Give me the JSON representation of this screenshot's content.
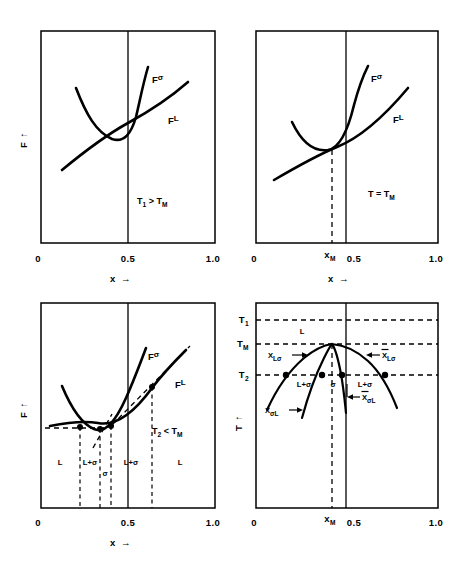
{
  "figure": {
    "kind": "four-panel-free-energy-and-phase-diagram",
    "panels": [
      {
        "id": "top-left",
        "position": "top-left",
        "condition": "T₁ > Tₘ",
        "condition_parts": {
          "lhs": "T",
          "lhs_sub": "1",
          "rel": ">",
          "rhs": "T",
          "rhs_sub": "M"
        },
        "xaxis": {
          "label": "x",
          "arrow": "→",
          "ticks": [
            "0",
            "0.5",
            "1.0"
          ],
          "tick_values": [
            0,
            0.5,
            1.0
          ]
        },
        "yaxis": {
          "label": "F",
          "arrow": "↑"
        },
        "curve_labels": [
          {
            "text": "F",
            "sup": "σ",
            "name": "sigma-free-energy"
          },
          {
            "text": "F",
            "sup": "L",
            "name": "liquid-free-energy"
          }
        ],
        "vertical_line_at": 0.5,
        "note": "Fsigma minimum lies above FL; no common tangent"
      },
      {
        "id": "top-right",
        "position": "top-right",
        "condition": "T = Tₘ",
        "condition_parts": {
          "lhs": "T",
          "rel": "=",
          "rhs": "T",
          "rhs_sub": "M"
        },
        "xaxis": {
          "label": "x",
          "arrow": "→",
          "ticks": [
            "0",
            "xₘ",
            "0.5",
            "1.0"
          ],
          "tick_values": [
            0,
            0.41,
            0.5,
            1.0
          ]
        },
        "yaxis": {
          "label": "F",
          "arrow": "↑"
        },
        "curve_labels": [
          {
            "text": "F",
            "sup": "σ",
            "name": "sigma-free-energy"
          },
          {
            "text": "F",
            "sup": "L",
            "name": "liquid-free-energy"
          }
        ],
        "vertical_line_at": 0.5,
        "dashed_marker": {
          "label": "x",
          "sub": "M",
          "x": 0.41
        },
        "note": "curves touch tangentially at x_M"
      },
      {
        "id": "bottom-left",
        "position": "bottom-left",
        "condition": "T₂ < Tₘ",
        "condition_parts": {
          "lhs": "T",
          "lhs_sub": "2",
          "rel": "<",
          "rhs": "T",
          "rhs_sub": "M"
        },
        "xaxis": {
          "label": "x",
          "arrow": "→",
          "ticks": [
            "0",
            "0.5",
            "1.0"
          ],
          "tick_values": [
            0,
            0.5,
            1.0
          ]
        },
        "yaxis": {
          "label": "F",
          "arrow": "↑"
        },
        "curve_labels": [
          {
            "text": "F",
            "sup": "σ",
            "name": "sigma-free-energy"
          },
          {
            "text": "F",
            "sup": "L",
            "name": "liquid-free-energy"
          }
        ],
        "vertical_line_at": 0.5,
        "tangent_x": [
          0.225,
          0.335,
          0.4,
          0.575
        ],
        "region_labels": [
          {
            "text": "L",
            "x": 0.11
          },
          {
            "text": "L+σ",
            "x": 0.28
          },
          {
            "text": "σ",
            "x": 0.368
          },
          {
            "text": "L+σ",
            "x": 0.487
          },
          {
            "text": "L",
            "x": 0.77
          }
        ],
        "note": "double common-tangent construction gives four phase boundaries"
      },
      {
        "id": "bottom-right",
        "position": "bottom-right",
        "xaxis": {
          "label": "x",
          "arrow": "→",
          "ticks": [
            "0",
            "xₘ",
            "0.5",
            "1.0"
          ],
          "tick_values": [
            0,
            0.41,
            0.5,
            1.0
          ]
        },
        "yaxis": {
          "label": "T",
          "arrow": "↑",
          "ticks": [
            "T₁",
            "Tₘ",
            "T₂"
          ]
        },
        "yaxis_tick_parts": [
          {
            "base": "T",
            "sub": "1"
          },
          {
            "base": "T",
            "sub": "M"
          },
          {
            "base": "T",
            "sub": "2"
          }
        ],
        "curve_labels": [
          {
            "base": "X",
            "sub": "Lσ",
            "bar": false,
            "name": "liquidus-left"
          },
          {
            "base": "X",
            "sub": "σL",
            "bar": false,
            "name": "solidus-left"
          },
          {
            "base": "X",
            "sub": "Lσ",
            "bar": true,
            "name": "liquidus-right"
          },
          {
            "base": "X",
            "sub": "σL",
            "bar": true,
            "name": "solidus-right"
          }
        ],
        "region_labels": [
          {
            "text": "L",
            "x": 0.29,
            "y_level": "above-TM"
          },
          {
            "text": "L+σ",
            "x": 0.275,
            "y_level": "T2"
          },
          {
            "text": "σ",
            "x": 0.375,
            "y_level": "T2"
          },
          {
            "text": "L+σ",
            "x": 0.545,
            "y_level": "T2"
          }
        ],
        "dashed_marker": {
          "label": "x",
          "sub": "M",
          "x": 0.41
        },
        "vertical_line_at": 0.5,
        "note": "congruent melting maximum at x_M with T1, TM, T2 isotherms dashed"
      }
    ],
    "symbols": {
      "sigma": "σ",
      "liquid": "L",
      "arrow_right": "→",
      "arrow_up": "↑",
      "overbar": "̄"
    },
    "colors": {
      "ink": "#000000",
      "background": "#ffffff"
    }
  }
}
